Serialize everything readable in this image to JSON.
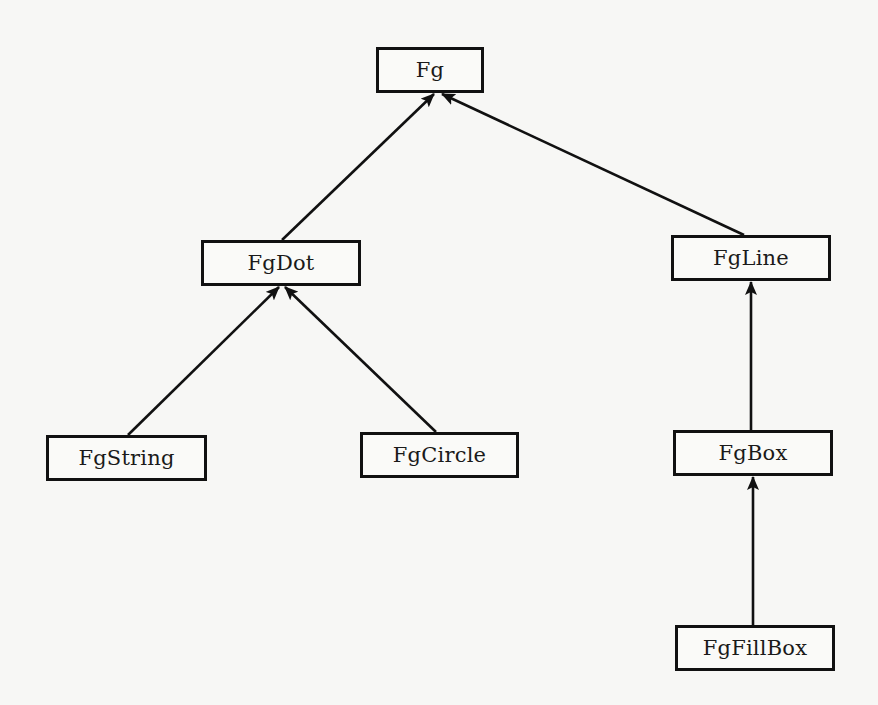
{
  "diagram": {
    "type": "class-hierarchy",
    "nodes": [
      {
        "id": "fg",
        "label": "Fg",
        "x": 376,
        "y": 47,
        "w": 108,
        "h": 46
      },
      {
        "id": "fgdot",
        "label": "FgDot",
        "x": 201,
        "y": 240,
        "w": 160,
        "h": 46
      },
      {
        "id": "fgline",
        "label": "FgLine",
        "x": 671,
        "y": 235,
        "w": 160,
        "h": 46
      },
      {
        "id": "fgstring",
        "label": "FgString",
        "x": 46,
        "y": 435,
        "w": 161,
        "h": 46
      },
      {
        "id": "fgcircle",
        "label": "FgCircle",
        "x": 360,
        "y": 432,
        "w": 159,
        "h": 46
      },
      {
        "id": "fgbox",
        "label": "FgBox",
        "x": 673,
        "y": 430,
        "w": 160,
        "h": 46
      },
      {
        "id": "fgfillbox",
        "label": "FgFillBox",
        "x": 675,
        "y": 625,
        "w": 160,
        "h": 46
      }
    ],
    "edges": [
      {
        "from": "fgdot",
        "to": "fg",
        "x1": 282,
        "y1": 240,
        "x2": 434,
        "y2": 94
      },
      {
        "from": "fgline",
        "to": "fg",
        "x1": 744,
        "y1": 235,
        "x2": 442,
        "y2": 94
      },
      {
        "from": "fgstring",
        "to": "fgdot",
        "x1": 128,
        "y1": 435,
        "x2": 279,
        "y2": 287
      },
      {
        "from": "fgcircle",
        "to": "fgdot",
        "x1": 436,
        "y1": 432,
        "x2": 285,
        "y2": 287
      },
      {
        "from": "fgbox",
        "to": "fgline",
        "x1": 751,
        "y1": 430,
        "x2": 751,
        "y2": 282
      },
      {
        "from": "fgfillbox",
        "to": "fgbox",
        "x1": 753,
        "y1": 625,
        "x2": 753,
        "y2": 477
      }
    ],
    "colors": {
      "stroke": "#111111",
      "background": "#f7f7f5",
      "text": "#1a1a1a"
    }
  }
}
